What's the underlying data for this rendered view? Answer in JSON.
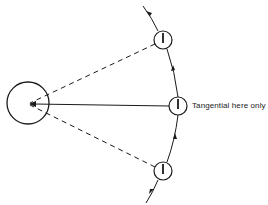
{
  "diagram": {
    "type": "orbital-geometry",
    "colors": {
      "stroke": "#1a1a1a",
      "background": "#ffffff"
    },
    "central_body": {
      "cx": 28,
      "cy": 103,
      "r": 21
    },
    "satellites": [
      {
        "id": "top",
        "cx": 163,
        "cy": 40,
        "r": 9,
        "line": "dashed"
      },
      {
        "id": "middle",
        "cx": 178,
        "cy": 106,
        "r": 9,
        "line": "solid"
      },
      {
        "id": "bottom",
        "cx": 163,
        "cy": 171,
        "r": 9,
        "line": "dashed"
      }
    ],
    "annotation": {
      "text": "Tangential here only",
      "x": 192,
      "y": 102
    }
  }
}
